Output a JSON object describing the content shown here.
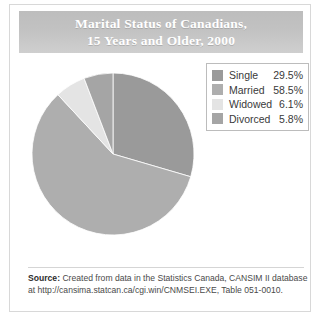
{
  "figure": {
    "title_line_1": "Marital Status of Canadians,",
    "title_line_2": "15 Years and Older, 2000",
    "source_label": "Source:",
    "source_text_line_1": "Created from data in the Statistics Canada, CANSIM II database",
    "source_text_line_2": "at http://cansima.statcan.ca/cgi.win/CNMSEI.EXE, Table 051-0010."
  },
  "legend": {
    "rows": [
      {
        "label": "Single",
        "value": "29.5%",
        "color": "#9a9a9a"
      },
      {
        "label": "Married",
        "value": "58.5%",
        "color": "#aeaeae"
      },
      {
        "label": "Widowed",
        "value": "6.1%",
        "color": "#e4e4e4"
      },
      {
        "label": "Divorced",
        "value": "5.8%",
        "color": "#a5a5a5"
      }
    ]
  },
  "chart_data": {
    "type": "pie",
    "title": "Marital Status of Canadians, 15 Years and Older, 2000",
    "labels": [
      "Single",
      "Married",
      "Widowed",
      "Divorced"
    ],
    "values": [
      29.5,
      58.5,
      6.1,
      5.8
    ],
    "value_labels": [
      "29.5%",
      "58.5%",
      "6.1%",
      "5.8%"
    ],
    "units": "percent",
    "colors": [
      "#9a9a9a",
      "#aeaeae",
      "#e4e4e4",
      "#a5a5a5"
    ],
    "start_angle_deg": 0,
    "direction": "clockwise",
    "legend_position": "right",
    "grid": false,
    "data_labels_on_slices": false
  }
}
